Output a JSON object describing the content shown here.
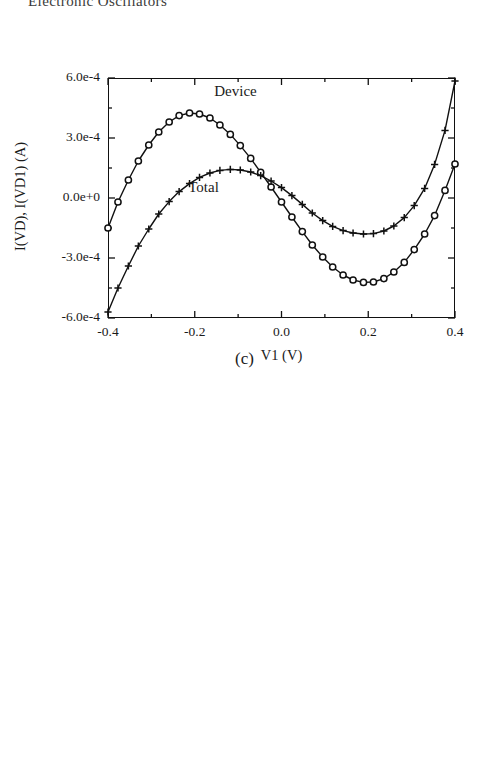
{
  "header": {
    "running_title": "Electronic Oscillators"
  },
  "figure_caption": {
    "label": "(c)"
  },
  "chart_data": [
    {
      "id": "iv-characteristic",
      "type": "line",
      "title": "",
      "xlabel": "V1  (V)",
      "ylabel": "I(VD), I(VD1)  (A)",
      "xlim": [
        -0.4,
        0.4
      ],
      "ylim": [
        -0.0006,
        0.0006
      ],
      "grid": false,
      "legend": "in-plot annotations",
      "xticks": [
        -0.4,
        -0.2,
        0.0,
        0.2,
        0.4
      ],
      "xticklabels": [
        "-0.4",
        "-0.2",
        "0.0",
        "0.2",
        "0.4"
      ],
      "yticks": [
        0.0006,
        0.0003,
        0.0,
        -0.0003,
        -0.0006
      ],
      "yticklabels": [
        "6.0e-4",
        "3.0e-4",
        "0.0e+0",
        "-3.0e-4",
        "-6.0e-4"
      ],
      "minor_xticks": [
        -0.3,
        -0.1,
        0.1,
        0.3
      ],
      "minor_yticks": [
        0.00045,
        0.00015,
        -0.00015,
        -0.00045
      ],
      "annotations": [
        {
          "text": "Device",
          "x": -0.155,
          "y": 0.00052
        },
        {
          "text": "Total",
          "x": -0.215,
          "y": 4e-05
        }
      ],
      "series": [
        {
          "name": "Device",
          "marker": "circle",
          "x": [
            -0.4,
            -0.377,
            -0.353,
            -0.33,
            -0.306,
            -0.283,
            -0.259,
            -0.236,
            -0.212,
            -0.189,
            -0.165,
            -0.142,
            -0.118,
            -0.095,
            -0.071,
            -0.048,
            -0.024,
            0.0,
            0.024,
            0.048,
            0.071,
            0.095,
            0.118,
            0.142,
            0.165,
            0.189,
            0.212,
            0.236,
            0.259,
            0.283,
            0.306,
            0.33,
            0.353,
            0.377,
            0.4
          ],
          "y": [
            -0.00015,
            -2e-05,
            9e-05,
            0.000185,
            0.000265,
            0.00033,
            0.00038,
            0.000412,
            0.000425,
            0.00042,
            0.0004,
            0.000365,
            0.000318,
            0.000262,
            0.000198,
            0.000128,
            5.5e-05,
            -2e-05,
            -9.5e-05,
            -0.000168,
            -0.000235,
            -0.000295,
            -0.000345,
            -0.000385,
            -0.00041,
            -0.000422,
            -0.00042,
            -0.000403,
            -0.00037,
            -0.000322,
            -0.000258,
            -0.00018,
            -8.8e-05,
            3.8e-05,
            0.00017
          ]
        },
        {
          "name": "Total",
          "marker": "plus",
          "x": [
            -0.4,
            -0.377,
            -0.353,
            -0.33,
            -0.306,
            -0.283,
            -0.259,
            -0.236,
            -0.212,
            -0.189,
            -0.165,
            -0.142,
            -0.118,
            -0.095,
            -0.071,
            -0.048,
            -0.024,
            0.0,
            0.024,
            0.048,
            0.071,
            0.095,
            0.118,
            0.142,
            0.165,
            0.189,
            0.212,
            0.236,
            0.259,
            0.283,
            0.306,
            0.33,
            0.353,
            0.377,
            0.4
          ],
          "y": [
            -0.00057,
            -0.00045,
            -0.00034,
            -0.00024,
            -0.000155,
            -8e-05,
            -1.8e-05,
            3.2e-05,
            7.2e-05,
            0.000103,
            0.000125,
            0.000138,
            0.000143,
            0.00014,
            0.00013,
            0.000112,
            8.5e-05,
            5.2e-05,
            1.2e-05,
            -3.2e-05,
            -7.5e-05,
            -0.000113,
            -0.000142,
            -0.000163,
            -0.000175,
            -0.00018,
            -0.000178,
            -0.000165,
            -0.00014,
            -9.8e-05,
            -3.8e-05,
            4.8e-05,
            0.000168,
            0.000338,
            0.000585
          ]
        }
      ]
    },
    {
      "id": "oscillator-waveform",
      "type": "line",
      "title": "",
      "xlabel": "Time  (µs)",
      "ylabel": "V(2)  (V)",
      "xlim": [
        0.8,
        0.9
      ],
      "ylim": [
        -0.4,
        0.4
      ],
      "grid": false,
      "xticks": [
        0.8,
        0.82,
        0.84,
        0.86,
        0.88,
        0.9
      ],
      "xticklabels": [
        "0.80",
        "0.82",
        "0.84",
        "0.86",
        "0.88",
        "0.90"
      ],
      "yticks": [
        0.4,
        0.2,
        0.0,
        -0.2,
        -0.4
      ],
      "yticklabels": [
        "0.4",
        "0.2",
        "0.0",
        "-0.2",
        "-0.4"
      ],
      "minor_xticks": [
        0.81,
        0.83,
        0.85,
        0.87,
        0.89
      ],
      "minor_yticks": [
        0.3,
        0.1,
        -0.1,
        -0.3
      ],
      "series": [
        {
          "name": "V(2)",
          "marker": "none",
          "period_us": 0.0338,
          "amplitude_v": 0.345,
          "x": [
            0.8,
            0.802,
            0.804,
            0.806,
            0.808,
            0.81,
            0.812,
            0.814,
            0.8155,
            0.817,
            0.8185,
            0.82,
            0.822,
            0.824,
            0.826,
            0.828,
            0.83,
            0.8315,
            0.833,
            0.8345,
            0.836,
            0.838,
            0.84,
            0.842,
            0.844,
            0.846,
            0.848,
            0.8495,
            0.851,
            0.8525,
            0.854,
            0.856,
            0.858,
            0.86,
            0.862,
            0.864,
            0.8655,
            0.867,
            0.8685,
            0.87,
            0.872,
            0.874,
            0.876,
            0.878,
            0.88,
            0.882,
            0.8835,
            0.885,
            0.8865,
            0.888,
            0.89,
            0.892,
            0.894,
            0.896,
            0.898,
            0.9
          ],
          "y": [
            0.32,
            0.245,
            0.15,
            0.04,
            -0.08,
            -0.19,
            -0.275,
            -0.325,
            -0.338,
            -0.335,
            -0.318,
            -0.285,
            -0.215,
            -0.125,
            -0.02,
            0.095,
            0.215,
            0.29,
            0.34,
            0.348,
            0.34,
            0.3,
            0.235,
            0.145,
            0.04,
            -0.075,
            -0.19,
            -0.265,
            -0.318,
            -0.338,
            -0.332,
            -0.3,
            -0.235,
            -0.145,
            -0.04,
            0.085,
            0.185,
            0.28,
            0.34,
            0.35,
            0.33,
            0.28,
            0.205,
            0.11,
            0.0,
            -0.12,
            -0.215,
            -0.295,
            -0.332,
            -0.335,
            -0.3,
            -0.23,
            -0.13,
            -0.01,
            0.14,
            0.318
          ]
        }
      ]
    }
  ]
}
